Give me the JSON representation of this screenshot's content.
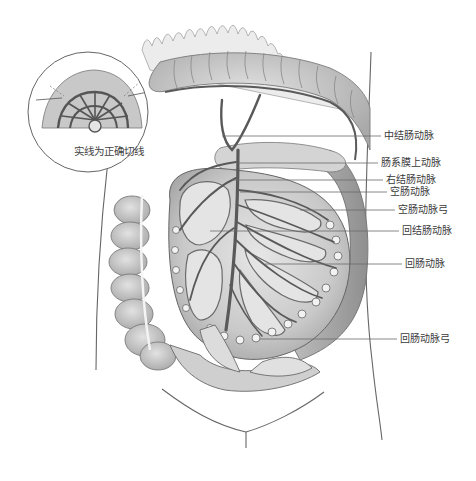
{
  "figure": {
    "type": "anatomical-illustration",
    "inset": {
      "caption": "实线为正确切线"
    },
    "labels": [
      {
        "id": "middle-colic-artery",
        "text": "中结肠动脉",
        "x": 384,
        "y": 130,
        "line_from": [
          222,
          136
        ],
        "line_to": [
          381,
          136
        ]
      },
      {
        "id": "superior-mesenteric-artery",
        "text": "肠系膜上动脉",
        "x": 381,
        "y": 157,
        "line_from": [
          238,
          163
        ],
        "line_to": [
          378,
          163
        ]
      },
      {
        "id": "right-colic-artery",
        "text": "右结肠动脉",
        "x": 386,
        "y": 174,
        "line_from": [
          232,
          180
        ],
        "line_to": [
          383,
          180
        ]
      },
      {
        "id": "jejunal-artery",
        "text": "空肠动脉",
        "x": 390,
        "y": 186,
        "line_from": [
          240,
          192
        ],
        "line_to": [
          387,
          192
        ]
      },
      {
        "id": "jejunal-arcade",
        "text": "空肠动脉弓",
        "x": 398,
        "y": 204,
        "line_from": [
          300,
          210
        ],
        "line_to": [
          395,
          210
        ]
      },
      {
        "id": "ileocolic-artery",
        "text": "回结肠动脉",
        "x": 402,
        "y": 225,
        "line_from": [
          210,
          231
        ],
        "line_to": [
          399,
          231
        ]
      },
      {
        "id": "ileal-artery",
        "text": "回肠动脉",
        "x": 405,
        "y": 258,
        "line_from": [
          265,
          264
        ],
        "line_to": [
          402,
          264
        ]
      },
      {
        "id": "ileal-arcade",
        "text": "回肠动脉弓",
        "x": 400,
        "y": 333,
        "line_from": [
          260,
          339
        ],
        "line_to": [
          397,
          339
        ]
      }
    ]
  },
  "colors": {
    "outline": "#555555",
    "vessel": "#5a5a5a",
    "tissue_light": "#d9d9d9",
    "tissue_mid": "#bdbdbd",
    "tissue_dark": "#9a9a9a",
    "leader_line": "#6a6a6a",
    "label_text": "#3a3a3a"
  }
}
